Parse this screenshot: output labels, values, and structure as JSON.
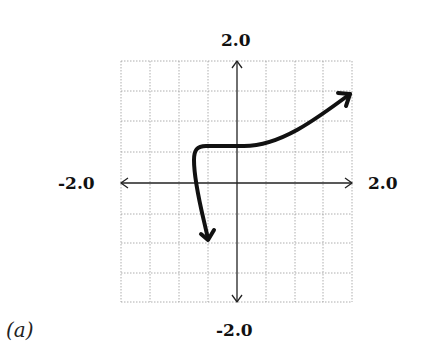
{
  "figure": {
    "caption": "(a)",
    "labels": {
      "y_max": "2.0",
      "y_min": "-2.0",
      "x_min": "-2.0",
      "x_max": "2.0"
    }
  },
  "graph": {
    "x_range": [
      -2.0,
      2.0
    ],
    "y_range": [
      -2.0,
      2.0
    ],
    "grid_divisions": 8,
    "grid_step": 0.5,
    "curve_description": "Curve starts with arrow pointing down near (-1.0,-0.85), rises nearly vertically to a sharp corner near (-1.3,0.6), runs flat near y=0.6 through the y-axis, then curves upward to an arrow near (1.95,1.5)",
    "curve_points": [
      {
        "x": -1.0,
        "y": -0.85
      },
      {
        "x": -1.2,
        "y": 0.0
      },
      {
        "x": -1.3,
        "y": 0.5
      },
      {
        "x": -1.1,
        "y": 0.62
      },
      {
        "x": 0.0,
        "y": 0.6
      },
      {
        "x": 0.8,
        "y": 0.8
      },
      {
        "x": 1.5,
        "y": 1.2
      },
      {
        "x": 1.95,
        "y": 1.55
      }
    ]
  }
}
